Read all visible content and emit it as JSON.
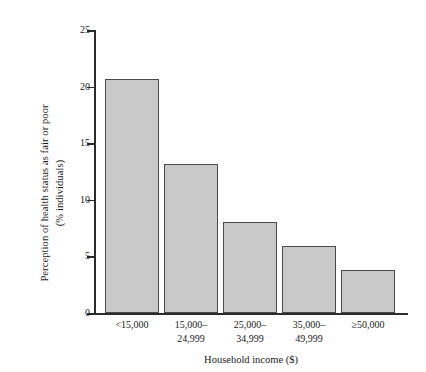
{
  "chart_data": {
    "type": "bar",
    "title": "",
    "subtitle": "",
    "xlabel": "Household income ($)",
    "ylabel_line1": "Perception of health status as fair or poor",
    "ylabel_line2": "(% individuals)",
    "ylabel": "Perception of health status as fair or poor (% individuals)",
    "categories": [
      "<15,000",
      "15,000–24,999",
      "25,000–34,999",
      "35,000–49,999",
      "≥50,000"
    ],
    "category_lines": [
      [
        "<15,000"
      ],
      [
        "15,000–",
        "24,999"
      ],
      [
        "25,000–",
        "34,999"
      ],
      [
        "35,000–",
        "49,999"
      ],
      [
        "≥50,000"
      ]
    ],
    "values": [
      20.7,
      13.2,
      8.0,
      5.9,
      3.8
    ],
    "ylim": [
      0,
      25
    ],
    "yticks": [
      0,
      5,
      10,
      15,
      20,
      25
    ],
    "ytick_labels": [
      "0",
      "5",
      "10",
      "15",
      "20",
      "25"
    ],
    "grid": false,
    "legend": false,
    "legend_position": "none",
    "bar_fill_color": "#c9c9c9",
    "bar_edge_color": "#4a4a4a",
    "axis_color": "#2b2b2b",
    "background_color": "#ffffff"
  }
}
